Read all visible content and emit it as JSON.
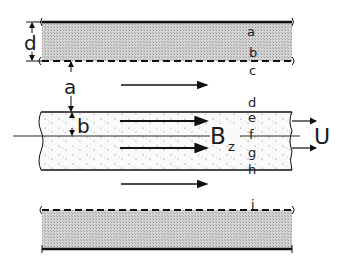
{
  "diagram": {
    "type": "channel flow schematic",
    "colors": {
      "hatch_fill": "#c8c8c8",
      "stipple_bg": "#f6f6f6",
      "line": "#111111"
    },
    "dimension_labels": {
      "d": "d",
      "a": "a",
      "b": "b"
    },
    "level_labels": {
      "a": "a",
      "b": "b",
      "c": "c",
      "d": "d",
      "e": "e",
      "f": "f",
      "g": "g",
      "h": "h",
      "i": "i"
    },
    "field_label": "B",
    "field_subscript": "z",
    "velocity_label": "U"
  }
}
